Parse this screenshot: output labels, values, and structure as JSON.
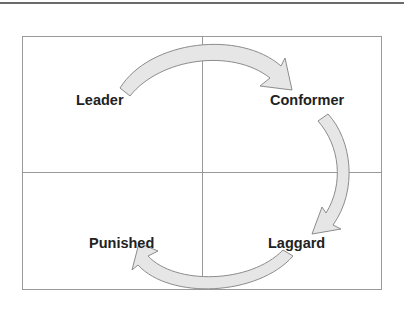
{
  "diagram": {
    "type": "quadrant-cycle",
    "quadrants": [
      {
        "position": "top-left",
        "label": "Leader"
      },
      {
        "position": "top-right",
        "label": "Conformer"
      },
      {
        "position": "bottom-right",
        "label": "Laggard"
      },
      {
        "position": "bottom-left",
        "label": "Punished"
      }
    ],
    "arrows": [
      {
        "from": "Leader",
        "to": "Conformer"
      },
      {
        "from": "Conformer",
        "to": "Laggard"
      },
      {
        "from": "Laggard",
        "to": "Punished"
      }
    ],
    "colors": {
      "arrow_fill": "#e6e6e6",
      "arrow_stroke": "#8c8c8c",
      "grid_line": "#9a9a9a",
      "label_text": "#222222"
    }
  }
}
